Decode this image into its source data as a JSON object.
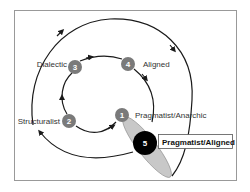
{
  "diagram": {
    "type": "cycle-diagram",
    "nodes": [
      {
        "id": "1",
        "number": "1",
        "label": "Pragmatist/Anarchic",
        "fill": "#7a7a7a"
      },
      {
        "id": "2",
        "number": "2",
        "label": "Structuralist",
        "fill": "#7a7a7a"
      },
      {
        "id": "3",
        "number": "3",
        "label": "Dialectic",
        "fill": "#7a7a7a"
      },
      {
        "id": "4",
        "number": "4",
        "label": "Aligned",
        "fill": "#7a7a7a"
      },
      {
        "id": "5",
        "number": "5",
        "label": "Pragmatist/Aligned",
        "fill": "#000000",
        "highlighted": true
      }
    ],
    "edges": [
      {
        "from": "1",
        "to": "2",
        "loop": "inner"
      },
      {
        "from": "2",
        "to": "3",
        "loop": "inner"
      },
      {
        "from": "3",
        "to": "4",
        "loop": "inner"
      },
      {
        "from": "4",
        "to": "1",
        "loop": "inner"
      },
      {
        "from": "2",
        "to": "5",
        "loop": "outer",
        "via": "top"
      }
    ],
    "colors": {
      "node": "#7a7a7a",
      "highlight_node": "#000000",
      "ellipse": "#c8c8c8",
      "line": "#1a1a1a",
      "frame": "#999999"
    }
  }
}
